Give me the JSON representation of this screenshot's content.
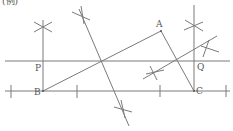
{
  "figure": {
    "caption": "(例)",
    "labels": {
      "A": "A",
      "B": "B",
      "C": "C",
      "P": "P",
      "Q": "Q"
    },
    "colors": {
      "line": "#7a7a7a",
      "text": "#555555",
      "background": "#ffffff"
    }
  }
}
